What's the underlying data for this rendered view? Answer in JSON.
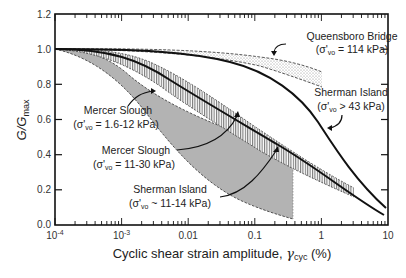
{
  "chart_data": {
    "type": "line",
    "title": "",
    "xlabel": "Cyclic shear strain amplitude, γcyc (%)",
    "xlabel_main": "Cyclic shear strain amplitude, ",
    "xlabel_symbol": "γ",
    "xlabel_sub": "cyc",
    "xlabel_unit": " (%)",
    "ylabel": "G/Gmax",
    "ylabel_main": "G/G",
    "ylabel_sub": "max",
    "xscale": "log",
    "xlim": [
      0.0001,
      10
    ],
    "ylim": [
      0.0,
      1.2
    ],
    "x_ticks": [
      "10-4",
      "10-3",
      "0.01",
      "0.1",
      "1",
      "10"
    ],
    "x_tick_labels": [
      {
        "base": "10",
        "exp": "-4"
      },
      {
        "base": "10",
        "exp": "-3"
      },
      {
        "text": "0.01"
      },
      {
        "text": "0.1"
      },
      {
        "text": "1"
      },
      {
        "text": "10"
      }
    ],
    "y_ticks": [
      "0.0",
      "0.2",
      "0.4",
      "0.6",
      "0.8",
      "1.0",
      "1.2"
    ],
    "grid": false,
    "legend": "none (inline annotations)",
    "series": [
      {
        "name": "Queensboro Bridge (σ'vo = 114 kPa)",
        "kind": "band (dotted fill, dashed bounds)",
        "x": [
          0.0001,
          0.001,
          0.01,
          0.1,
          1
        ],
        "upper": [
          1.0,
          1.0,
          0.995,
          0.98,
          0.95
        ],
        "lower": [
          1.0,
          0.995,
          0.98,
          0.95,
          0.89
        ]
      },
      {
        "name": "Sherman Island (σ'vo > 43 kPa)",
        "kind": "solid line",
        "x": [
          0.0001,
          0.001,
          0.01,
          0.1,
          0.3,
          1,
          3,
          10
        ],
        "values": [
          1.0,
          1.0,
          0.98,
          0.87,
          0.72,
          0.45,
          0.25,
          0.13
        ]
      },
      {
        "name": "Mercer Slough (σ'vo = 11-30 kPa)",
        "kind": "band (vertical hatch, dashed bounds) + solid reference line",
        "x": [
          0.0001,
          0.001,
          0.01,
          0.1,
          1,
          3
        ],
        "upper": [
          1.0,
          0.99,
          0.88,
          0.62,
          0.35,
          0.23
        ],
        "lower": [
          1.0,
          0.97,
          0.82,
          0.55,
          0.28,
          0.2
        ]
      },
      {
        "name": "Sherman Island reference (solid, lower)",
        "kind": "solid line",
        "x": [
          0.0001,
          0.001,
          0.01,
          0.1,
          1,
          10
        ],
        "values": [
          1.0,
          0.99,
          0.86,
          0.58,
          0.3,
          0.07
        ]
      },
      {
        "name": "Mercer Slough (σ'vo = 1.6-12 kPa)",
        "kind": "band (grey fill, dashed bounds)",
        "x": [
          0.0001,
          0.001,
          0.01,
          0.1,
          0.7
        ],
        "upper": [
          1.0,
          0.95,
          0.78,
          0.52,
          0.35
        ],
        "lower": [
          1.0,
          0.9,
          0.62,
          0.25,
          0.05
        ]
      },
      {
        "name": "Sherman Island (σ'vo ~ 11-14 kPa)",
        "kind": "dashed line (lower bound region)",
        "x": [
          0.0001,
          0.001,
          0.01,
          0.1,
          0.7
        ],
        "values": [
          1.0,
          0.9,
          0.62,
          0.25,
          0.05
        ]
      }
    ],
    "annotations": [
      {
        "line1": "Queensboro Bridge",
        "line2": "(σ'vo = 114 kPa)"
      },
      {
        "line1": "Sherman Island",
        "line2": "(σ'vo > 43 kPa)"
      },
      {
        "line1": "Mercer Slough",
        "line2": "(σ'vo = 1.6-12 kPa)"
      },
      {
        "line1": "Mercer Slough",
        "line2": "(σ'vo = 11-30 kPa)"
      },
      {
        "line1": "Sherman Island",
        "line2": "(σ'vo ~ 11-14 kPa)"
      }
    ]
  },
  "labels": {
    "ann_qb_1": "Queensboro Bridge",
    "ann_qb_2a": "(σ'",
    "ann_qb_2sub": "vo",
    "ann_qb_2b": " = 114 kPa)",
    "ann_si1_1": "Sherman Island",
    "ann_si1_2a": "(σ'",
    "ann_si1_2sub": "vo",
    "ann_si1_2b": " > 43 kPa)",
    "ann_ms1_1": "Mercer Slough",
    "ann_ms1_2a": "(σ'",
    "ann_ms1_2sub": "vo",
    "ann_ms1_2b": " = 1.6-12 kPa)",
    "ann_ms2_1": "Mercer Slough",
    "ann_ms2_2a": "(σ'",
    "ann_ms2_2sub": "vo",
    "ann_ms2_2b": " = 11-30 kPa)",
    "ann_si2_1": "Sherman Island",
    "ann_si2_2a": "(σ'",
    "ann_si2_2sub": "vo",
    "ann_si2_2b": " ~ 11-14 kPa)"
  },
  "colors": {
    "grey_band": "#b3b3b3",
    "line": "#111111",
    "axis": "#111111"
  }
}
